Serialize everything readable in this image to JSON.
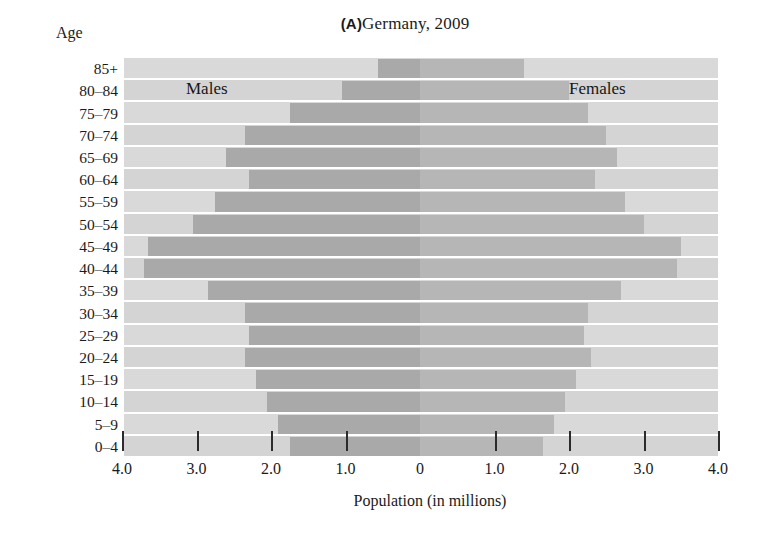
{
  "figure": {
    "panel_letter": "(A)",
    "title": "Germany, 2009",
    "title_full": "(A) Germany, 2009",
    "age_axis_label": "Age",
    "xaxis_title": "Population (in millions)",
    "male_label": "Males",
    "female_label": "Females"
  },
  "colors": {
    "page_background": "#ffffff",
    "plot_background": "#d9d9d9",
    "plot_background_alt": "#d4d4d4",
    "male_bar": "#a9a9a9",
    "female_bar": "#b6b6b6",
    "gridline": "#ffffff",
    "tick": "#2b2b2b",
    "text": "#1a1a1a"
  },
  "chart_data": {
    "type": "bar",
    "subtype": "population-pyramid",
    "xlabel": "Population (in millions)",
    "ylabel": "Age",
    "xlim": [
      -4.0,
      4.0
    ],
    "xticks": [
      -4.0,
      -3.0,
      -2.0,
      -1.0,
      0,
      1.0,
      2.0,
      3.0,
      4.0
    ],
    "xticklabels": [
      "4.0",
      "3.0",
      "2.0",
      "1.0",
      "0",
      "1.0",
      "2.0",
      "3.0",
      "4.0"
    ],
    "grid": true,
    "legend_position": "inside-top",
    "categories": [
      "85+",
      "80–84",
      "75–79",
      "70–74",
      "65–69",
      "60–64",
      "55–59",
      "50–54",
      "45–49",
      "40–44",
      "35–39",
      "30–34",
      "25–29",
      "20–24",
      "15–19",
      "10–14",
      "5–9",
      "0–4"
    ],
    "series": [
      {
        "name": "Males",
        "side": "left",
        "color": "#a9a9a9",
        "values": [
          0.57,
          1.05,
          1.75,
          2.35,
          2.6,
          2.3,
          2.75,
          3.05,
          3.65,
          3.7,
          2.85,
          2.35,
          2.3,
          2.35,
          2.2,
          2.05,
          1.9,
          1.75
        ]
      },
      {
        "name": "Females",
        "side": "right",
        "color": "#b6b6b6",
        "values": [
          1.4,
          2.0,
          2.25,
          2.5,
          2.65,
          2.35,
          2.75,
          3.0,
          3.5,
          3.45,
          2.7,
          2.25,
          2.2,
          2.3,
          2.1,
          1.95,
          1.8,
          1.65
        ]
      }
    ],
    "annotations": [
      {
        "text": "Males",
        "x": -2.0,
        "y": "80–84"
      },
      {
        "text": "Females",
        "x": 2.0,
        "y": "80–84"
      }
    ]
  }
}
